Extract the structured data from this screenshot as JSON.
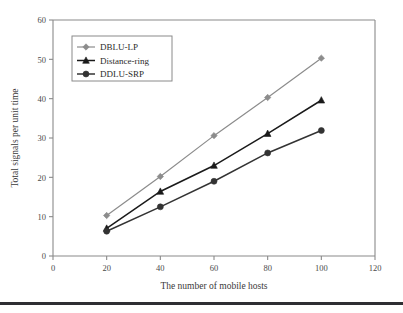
{
  "figure": {
    "background": "#ffffff",
    "axis_color": "#8a8a8a",
    "bottom_rule_color": "#2f2f33"
  },
  "chart_data": {
    "type": "line",
    "title": "",
    "xlabel": "The number of mobile hosts",
    "ylabel": "Total signals per unit time",
    "x": [
      20,
      40,
      60,
      80,
      100
    ],
    "xlim": [
      0,
      120
    ],
    "ylim": [
      0,
      60
    ],
    "xticks": [
      0,
      20,
      40,
      60,
      80,
      100,
      120
    ],
    "yticks": [
      0,
      10,
      20,
      30,
      40,
      50,
      60
    ],
    "grid": false,
    "legend_position": "upper-left",
    "series": [
      {
        "name": "DBLU-LP",
        "values": [
          10.3,
          20.2,
          30.6,
          40.3,
          50.3
        ],
        "color": "#8c8c8c",
        "marker": "diamond"
      },
      {
        "name": "Distance-ring",
        "values": [
          7.0,
          16.4,
          23.0,
          31.1,
          39.6
        ],
        "color": "#1a1a1a",
        "marker": "triangle"
      },
      {
        "name": "DDLU-SRP",
        "values": [
          6.3,
          12.5,
          19.0,
          26.2,
          31.9
        ],
        "color": "#333333",
        "marker": "circle"
      }
    ]
  },
  "axis": {
    "xtick_labels": [
      "0",
      "20",
      "40",
      "60",
      "80",
      "100",
      "120"
    ],
    "ytick_labels": [
      "0",
      "10",
      "20",
      "30",
      "40",
      "50",
      "60"
    ]
  }
}
